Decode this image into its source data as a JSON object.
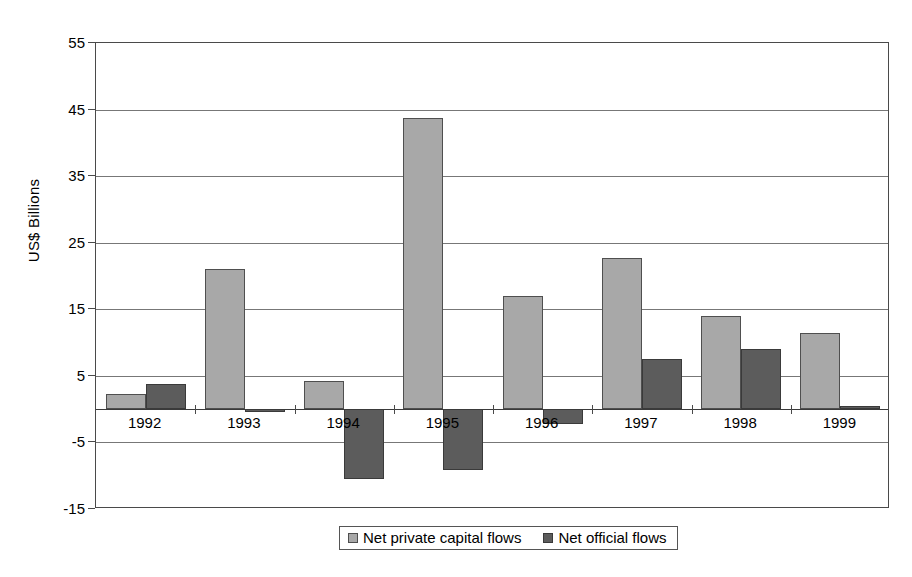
{
  "chart_data": {
    "type": "bar",
    "title": "",
    "subtitle": "",
    "xlabel": "",
    "ylabel": "US$ Billions",
    "ylim": [
      -15,
      55
    ],
    "ytick_step": 10,
    "yticks": [
      55,
      45,
      35,
      25,
      15,
      5,
      -5,
      -15
    ],
    "ytick_labels": [
      "55",
      "45",
      "35",
      "25",
      "15",
      "5",
      "-5",
      "-15"
    ],
    "grid": true,
    "legend_position": "bottom-center",
    "categories": [
      "1992",
      "1993",
      "1994",
      "1995",
      "1996",
      "1997",
      "1998",
      "1999"
    ],
    "series": [
      {
        "name": "Net private capital flows",
        "color": "#a8a8a8",
        "values": [
          2.3,
          21.0,
          4.3,
          43.7,
          17.0,
          22.7,
          14.0,
          11.5
        ]
      },
      {
        "name": "Net official flows",
        "color": "#5c5c5c",
        "values": [
          3.8,
          -0.5,
          -10.5,
          -9.1,
          -2.3,
          7.5,
          9.0,
          0.4
        ]
      }
    ]
  },
  "legend": {
    "items": [
      {
        "label": "Net private capital flows",
        "swatch": "legend-swatch-private"
      },
      {
        "label": "Net official flows",
        "swatch": "legend-swatch-official"
      }
    ]
  },
  "axis": {
    "y_title": "US$ Billions"
  }
}
